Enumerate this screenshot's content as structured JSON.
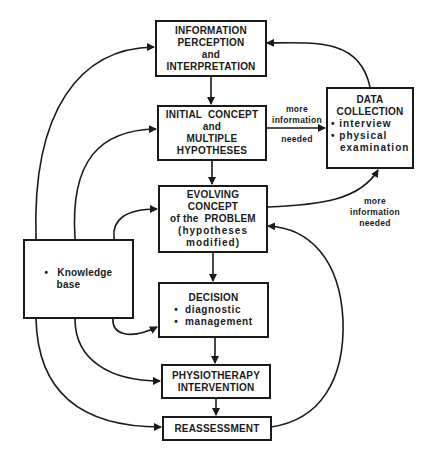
{
  "diagram": {
    "nodes": {
      "info": {
        "lines": [
          "INFORMATION",
          "PERCEPTION",
          "and",
          "INTERPRETATION"
        ]
      },
      "initial": {
        "lines": [
          "INITIAL  CONCEPT",
          "and",
          "MULTIPLE",
          "HYPOTHESES"
        ]
      },
      "data": {
        "title": [
          "DATA",
          "COLLECTION"
        ],
        "bullets": [
          "interview",
          "physical",
          "examination"
        ]
      },
      "evolving": {
        "lines": [
          "EVOLVING",
          "CONCEPT",
          "of the  PROBLEM",
          "(hypotheses",
          "modified)"
        ]
      },
      "knowledge": {
        "bullets": [
          "Knowledge",
          "base"
        ]
      },
      "decision": {
        "title": "DECISION",
        "bullets": [
          "diagnostic",
          "management"
        ]
      },
      "physio": {
        "lines": [
          "PHYSIOTHERAPY",
          "INTERVENTION"
        ]
      },
      "reassess": {
        "lines": [
          "REASSESSMENT"
        ]
      }
    },
    "edge_labels": {
      "initial_to_data": [
        "more",
        "information",
        "needed"
      ],
      "evolving_to_data": [
        "more",
        "information",
        "needed"
      ]
    },
    "colors": {
      "line": "#1a1a1a",
      "background": "#ffffff"
    }
  }
}
